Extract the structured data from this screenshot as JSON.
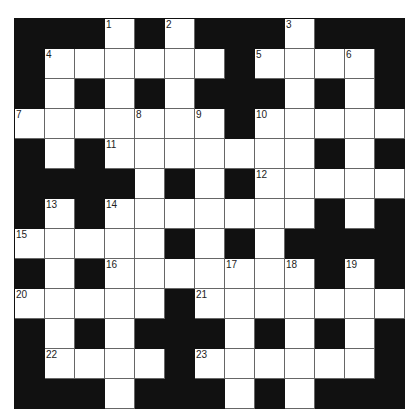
{
  "puzzle": {
    "size": 13,
    "colors": {
      "block": "#111111",
      "cell": "#ffffff",
      "line": "#666666"
    },
    "layout": [
      "###.#.###.###",
      "#......#....#",
      "#.#.#.###.#.#",
      ".......#.....",
      "#.#.......#.#",
      "####.#.#.....",
      "#.#.......#.#",
      ".....#.#.####",
      "#.#.......#.#",
      ".....#.......",
      "#.#.###.#.#.#",
      "#....#......#",
      "###.###.#.###"
    ],
    "numbers": [
      {
        "r": 0,
        "c": 3,
        "n": "1"
      },
      {
        "r": 0,
        "c": 5,
        "n": "2"
      },
      {
        "r": 0,
        "c": 9,
        "n": "3"
      },
      {
        "r": 1,
        "c": 1,
        "n": "4"
      },
      {
        "r": 1,
        "c": 8,
        "n": "5"
      },
      {
        "r": 1,
        "c": 11,
        "n": "6"
      },
      {
        "r": 3,
        "c": 0,
        "n": "7"
      },
      {
        "r": 3,
        "c": 4,
        "n": "8"
      },
      {
        "r": 3,
        "c": 6,
        "n": "9"
      },
      {
        "r": 3,
        "c": 8,
        "n": "10"
      },
      {
        "r": 4,
        "c": 3,
        "n": "11"
      },
      {
        "r": 5,
        "c": 8,
        "n": "12"
      },
      {
        "r": 6,
        "c": 1,
        "n": "13"
      },
      {
        "r": 6,
        "c": 3,
        "n": "14"
      },
      {
        "r": 7,
        "c": 0,
        "n": "15"
      },
      {
        "r": 8,
        "c": 3,
        "n": "16"
      },
      {
        "r": 8,
        "c": 7,
        "n": "17"
      },
      {
        "r": 8,
        "c": 9,
        "n": "18"
      },
      {
        "r": 8,
        "c": 11,
        "n": "19"
      },
      {
        "r": 9,
        "c": 0,
        "n": "20"
      },
      {
        "r": 9,
        "c": 6,
        "n": "21"
      },
      {
        "r": 11,
        "c": 1,
        "n": "22"
      },
      {
        "r": 11,
        "c": 6,
        "n": "23"
      }
    ]
  }
}
